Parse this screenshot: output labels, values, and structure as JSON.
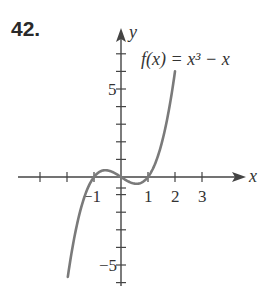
{
  "problem_number": "42.",
  "chart_data": {
    "type": "line",
    "title": "",
    "function_label": "f(x) = x³ − x",
    "xlabel": "x",
    "ylabel": "y",
    "xlim": [
      -3.8,
      4.6
    ],
    "ylim": [
      -6.1,
      8.4
    ],
    "x_ticks": [
      -3,
      -2,
      -1,
      0,
      1,
      2,
      3
    ],
    "x_tick_labels": [
      {
        "value": -1,
        "text": "−1"
      },
      {
        "value": 1,
        "text": "1"
      },
      {
        "value": 2,
        "text": "2"
      },
      {
        "value": 3,
        "text": "3"
      }
    ],
    "y_ticks": [
      -6,
      -5,
      -4,
      -3,
      -2,
      -1,
      1,
      2,
      3,
      4,
      5,
      6,
      7
    ],
    "y_tick_labels": [
      {
        "value": 5,
        "text": "5"
      },
      {
        "value": -5,
        "text": "−5"
      }
    ],
    "series": [
      {
        "name": "f(x) = x^3 - x",
        "domain": [
          -1.97,
          2.0
        ],
        "color": "#7a7a7a",
        "x": [
          -1.97,
          -1.5,
          -1,
          -0.577,
          0,
          0.577,
          1,
          1.5,
          2.0
        ],
        "y": [
          -5.68,
          -1.88,
          0,
          0.385,
          0,
          -0.385,
          0,
          1.88,
          6.0
        ]
      }
    ],
    "grid": false,
    "legend": "none"
  },
  "colors": {
    "axis": "#444444",
    "curve": "#7a7a7a",
    "text": "#2a2a2a"
  }
}
